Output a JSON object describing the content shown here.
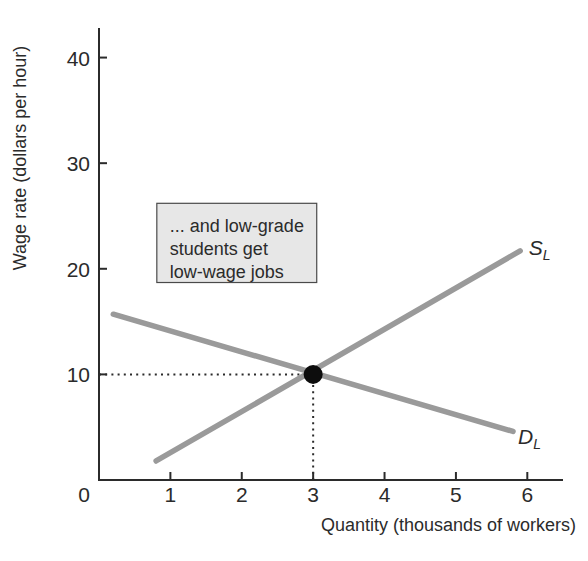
{
  "chart_data": {
    "type": "line",
    "title": "",
    "xlabel": "Quantity (thousands of workers)",
    "ylabel": "Wage rate (dollars per hour)",
    "xlim": [
      0,
      6.5
    ],
    "ylim": [
      0,
      42.8
    ],
    "x_ticks": [
      0,
      1,
      2,
      3,
      4,
      5,
      6
    ],
    "y_ticks": [
      10,
      20,
      30,
      40
    ],
    "grid": false,
    "legend": "none",
    "series": [
      {
        "name": "labor-supply",
        "label": "S",
        "label_sub": "L",
        "points": [
          [
            0.8,
            1.8
          ],
          [
            5.9,
            21.7
          ]
        ],
        "label_pos": [
          6.02,
          21.3
        ]
      },
      {
        "name": "labor-demand",
        "label": "D",
        "label_sub": "L",
        "points": [
          [
            0.2,
            15.7
          ],
          [
            5.8,
            4.6
          ]
        ],
        "label_pos": [
          5.87,
          3.4
        ]
      }
    ],
    "equilibrium": {
      "x": 3,
      "y": 10
    },
    "guides": [
      {
        "name": "wage-guide",
        "from": [
          0,
          10
        ],
        "to": [
          3,
          10
        ],
        "style": "dotted"
      },
      {
        "name": "quantity-guide",
        "from": [
          3,
          0
        ],
        "to": [
          3,
          10
        ],
        "style": "dotted"
      }
    ],
    "annotation": {
      "lines": [
        "... and low-grade",
        "students get",
        "low-wage jobs"
      ],
      "box": {
        "x": 0.81,
        "y_top": 26.2,
        "w": 2.24,
        "h": 7.5
      }
    },
    "colors": {
      "curve": "#9a9a9a",
      "axis": "#2b2b2b",
      "text": "#2b2b2b",
      "equilibrium_dot": "#0d0d0d",
      "guide": "#2b2b2b",
      "annotation_fill": "#e7e7e7",
      "annotation_border": "#4a4a4a",
      "background": "#ffffff"
    }
  }
}
